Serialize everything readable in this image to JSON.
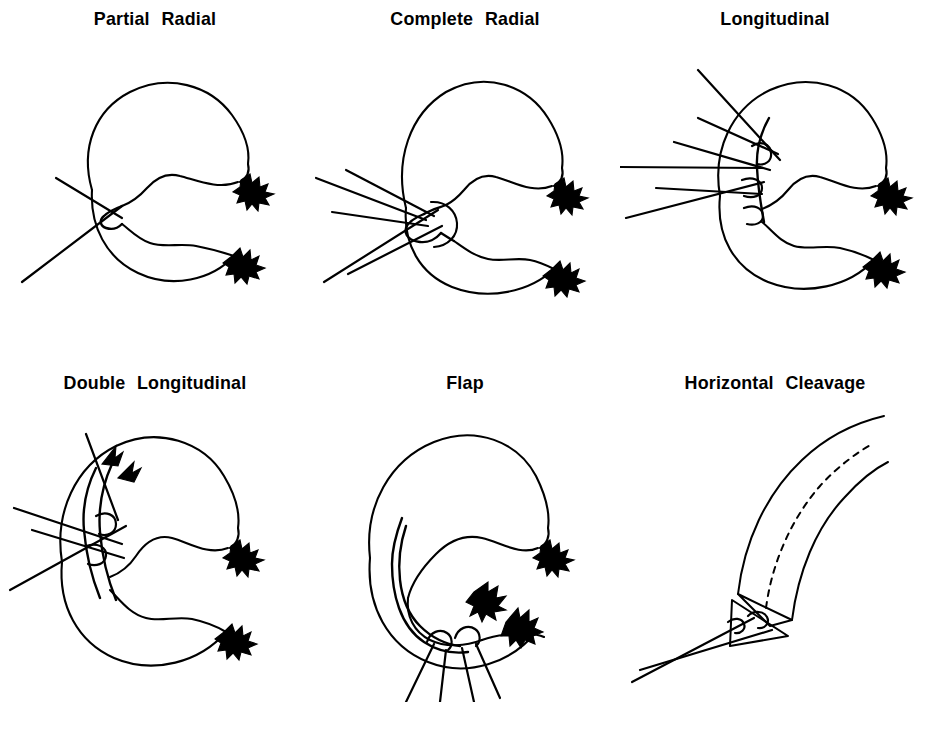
{
  "figure": {
    "caption_present": false,
    "background_color": "#ffffff",
    "ink_color": "#000000",
    "rows": 2,
    "columns": 3
  },
  "panels": [
    {
      "id": "partial-radial",
      "title": "Partial  Radial",
      "row": 1,
      "column": 1,
      "tear_type": "partial radial",
      "probe_count": 1,
      "view": "top-down C-shaped meniscus"
    },
    {
      "id": "complete-radial",
      "title": "Complete  Radial",
      "row": 1,
      "column": 2,
      "tear_type": "complete radial",
      "probe_count": 5,
      "view": "top-down C-shaped meniscus"
    },
    {
      "id": "longitudinal",
      "title": "Longitudinal",
      "row": 1,
      "column": 3,
      "tear_type": "longitudinal",
      "probe_count": 5,
      "view": "top-down C-shaped meniscus"
    },
    {
      "id": "double-longitudinal",
      "title": "Double  Longitudinal",
      "row": 2,
      "column": 1,
      "tear_type": "double longitudinal",
      "probe_count": 4,
      "view": "top-down C-shaped meniscus"
    },
    {
      "id": "flap",
      "title": "Flap",
      "row": 2,
      "column": 2,
      "tear_type": "flap",
      "probe_count": 3,
      "view": "top-down C-shaped meniscus"
    },
    {
      "id": "horizontal-cleavage",
      "title": "Horizontal  Cleavage",
      "row": 2,
      "column": 3,
      "tear_type": "horizontal cleavage",
      "probe_count": 1,
      "view": "cut-away wedge cross-section"
    }
  ]
}
